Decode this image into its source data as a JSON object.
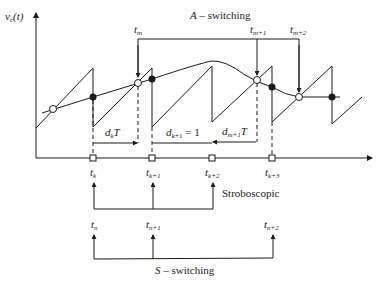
{
  "diagram": {
    "y_axis_label": {
      "main": "v",
      "sub": "c",
      "arg": "(t)"
    },
    "top_bracket": {
      "title_var": "A",
      "title_rest": " – switching",
      "labels": [
        {
          "main": "t",
          "sub": "m"
        },
        {
          "main": "t",
          "sub": "m+1"
        },
        {
          "main": "t",
          "sub": "m+2"
        }
      ]
    },
    "intervals": [
      {
        "main": "d",
        "sub": "k",
        "rest": "T"
      },
      {
        "main": "d",
        "sub": "k+1",
        "rest": " = 1"
      },
      {
        "main": "d",
        "sub": "m+1",
        "rest": "T"
      }
    ],
    "axis_ticks": [
      {
        "main": "t",
        "sub": "k"
      },
      {
        "main": "t",
        "sub": "k+1"
      },
      {
        "main": "t",
        "sub": "k+2"
      },
      {
        "main": "t",
        "sub": "k+3"
      }
    ],
    "stroboscopic_label": "Stroboscopic",
    "bottom_bracket": {
      "title_var": "S",
      "title_rest": " – switching",
      "labels": [
        {
          "main": "t",
          "sub": "n"
        },
        {
          "main": "t",
          "sub": "n+1"
        },
        {
          "main": "t",
          "sub": "n+2"
        }
      ]
    },
    "colors": {
      "ink": "#1a1a1a",
      "background": "#ffffff"
    }
  }
}
